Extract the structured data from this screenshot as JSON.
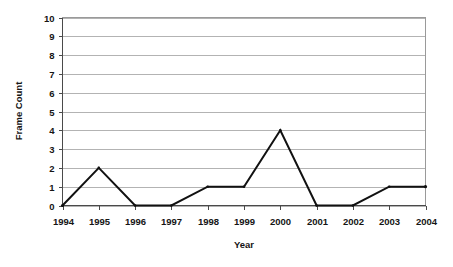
{
  "chart_data": {
    "type": "line",
    "title": "",
    "xlabel": "Year",
    "ylabel": "Frame Count",
    "categories": [
      "1994",
      "1995",
      "1996",
      "1997",
      "1998",
      "1999",
      "2000",
      "2001",
      "2002",
      "2003",
      "2004"
    ],
    "values": [
      0,
      2,
      0,
      0,
      1,
      1,
      4,
      0,
      0,
      1,
      1
    ],
    "ylim": [
      0,
      10
    ],
    "ytick_labels": [
      "0",
      "1",
      "2",
      "3",
      "4",
      "5",
      "6",
      "7",
      "8",
      "9",
      "10"
    ],
    "ytick_values": [
      0,
      1,
      2,
      3,
      4,
      5,
      6,
      7,
      8,
      9,
      10
    ],
    "grid": "horizontal",
    "legend": "none",
    "series": [
      {
        "name": "Frame Count",
        "color": "#111111",
        "values": [
          0,
          2,
          0,
          0,
          1,
          1,
          4,
          0,
          0,
          1,
          1
        ]
      }
    ],
    "colors": {
      "line": "#111111",
      "gridline": "#b3b3b3",
      "axis": "#4a4a4a",
      "frame": "#9a9a9a",
      "text": "#151515",
      "background": "#ffffff"
    }
  }
}
